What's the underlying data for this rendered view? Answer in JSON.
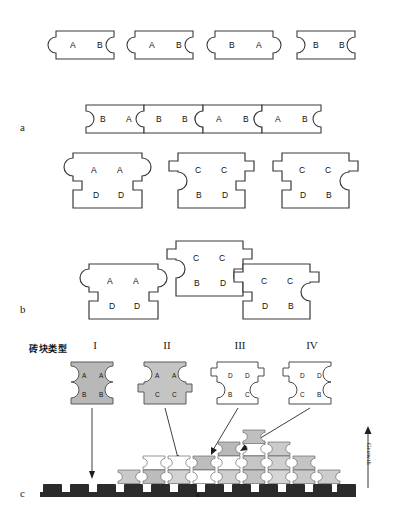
{
  "figure": {
    "panels": [
      {
        "id": "a",
        "label": "a"
      },
      {
        "id": "b",
        "label": "b"
      },
      {
        "id": "c",
        "label": "c"
      }
    ]
  },
  "panel_a": {
    "label": "a",
    "row1": {
      "bricks": [
        {
          "index": 1,
          "domains": [
            "A",
            "B"
          ],
          "left_edge": "concave",
          "right_edge": "concave"
        },
        {
          "index": 2,
          "domains": [
            "A",
            "B"
          ],
          "left_edge": "concave",
          "right_edge": "concave"
        },
        {
          "index": 3,
          "domains": [
            "B",
            "A"
          ],
          "left_edge": "concave",
          "right_edge": "convex"
        },
        {
          "index": 4,
          "domains": [
            "B",
            "B"
          ],
          "left_edge": "convex",
          "right_edge": "concave"
        }
      ]
    },
    "row2": {
      "bricks": [
        {
          "index": 1,
          "domains": [
            "B",
            "A"
          ],
          "left_edge": "convex",
          "right_edge": "convex"
        },
        {
          "index": 2,
          "domains": [
            "B",
            "B"
          ],
          "left_edge": "concave",
          "right_edge": "concave"
        },
        {
          "index": 3,
          "domains": [
            "A",
            "B"
          ],
          "left_edge": "concave",
          "right_edge": "concave"
        },
        {
          "index": 4,
          "domains": [
            "A",
            "B"
          ],
          "left_edge": "concave",
          "right_edge": "concave"
        }
      ]
    },
    "row3": {
      "bricks": [
        {
          "index": 1,
          "top": [
            "A",
            "A"
          ],
          "bottom": [
            "D",
            "D"
          ],
          "left_edge": "convex-round",
          "right_edge": "convex-round"
        },
        {
          "index": 2,
          "top": [
            "C",
            "C"
          ],
          "bottom": [
            "B",
            "D"
          ],
          "left_edge": "stepped-concave",
          "right_edge": "stepped"
        },
        {
          "index": 3,
          "top": [
            "C",
            "C"
          ],
          "bottom": [
            "D",
            "B"
          ],
          "left_edge": "stepped",
          "right_edge": "stepped-concave"
        }
      ]
    }
  },
  "panel_b": {
    "label": "b",
    "bricks": [
      {
        "index": 1,
        "top": [
          "A",
          "A"
        ],
        "bottom": [
          "D",
          "D"
        ],
        "position": "lower-left"
      },
      {
        "index": 2,
        "top": [
          "C",
          "C"
        ],
        "bottom": [
          "B",
          "D"
        ],
        "position": "upper-center"
      },
      {
        "index": 3,
        "top": [
          "C",
          "C"
        ],
        "bottom": [
          "D",
          "B"
        ],
        "position": "lower-right"
      }
    ]
  },
  "panel_c": {
    "label": "c",
    "legend_title": "砖块类型",
    "growth_label": "Growth",
    "types": [
      {
        "numeral": "I",
        "top": [
          "A",
          "A"
        ],
        "bottom": [
          "B",
          "B"
        ],
        "fill": "#b8b8b8",
        "shape": "round-round"
      },
      {
        "numeral": "II",
        "top": [
          "A",
          "A"
        ],
        "bottom": [
          "C",
          "C"
        ],
        "fill": "#c4c4c4",
        "shape": "round-step"
      },
      {
        "numeral": "III",
        "top": [
          "D",
          "D"
        ],
        "bottom": [
          "B",
          "C"
        ],
        "fill": "#ffffff",
        "shape": "step-round"
      },
      {
        "numeral": "IV",
        "top": [
          "D",
          "D"
        ],
        "bottom": [
          "C",
          "B"
        ],
        "fill": "#ffffff",
        "shape": "step-round-right"
      }
    ],
    "assembly": {
      "substrate_color": "#2b2b2b",
      "rows": [
        {
          "row": 1,
          "tiles": [
            "III",
            "I",
            "I",
            "I",
            "III",
            "III",
            "I",
            "I",
            "I",
            "I",
            "I",
            "I"
          ]
        },
        {
          "row": 2,
          "tiles": [
            "III",
            "III",
            "II",
            "I",
            "II",
            "I",
            "I",
            "I"
          ]
        },
        {
          "row": 3,
          "tiles": [
            "II",
            "III",
            "II",
            "I"
          ]
        },
        {
          "row": 4,
          "tiles": [
            "II"
          ]
        }
      ]
    },
    "colors": {
      "type_I_fill": "#b8b8b8",
      "type_II_fill": "#c9c9c9",
      "type_III_fill": "#ffffff",
      "type_IV_fill": "#ffffff",
      "outline": "#333333",
      "substrate": "#2b2b2b"
    }
  }
}
